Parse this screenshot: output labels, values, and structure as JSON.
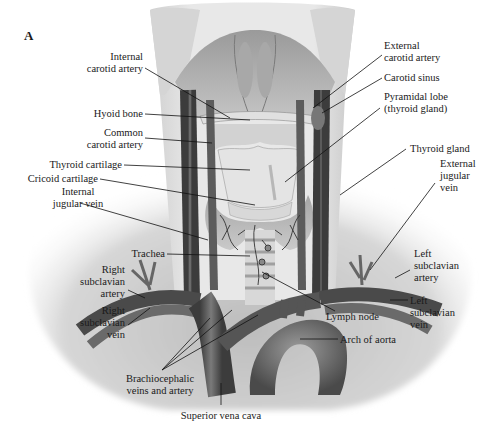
{
  "figure": {
    "panel_letter": "A",
    "labels": [
      {
        "id": "internal-carotid-artery",
        "lines": [
          "Internal",
          "carotid artery"
        ],
        "x": 143,
        "y": 60,
        "anchor": "end",
        "leader": [
          [
            145,
            68
          ],
          [
            230,
            118
          ]
        ]
      },
      {
        "id": "hyoid-bone",
        "lines": [
          "Hyoid bone"
        ],
        "x": 143,
        "y": 117,
        "anchor": "end",
        "leader": [
          [
            145,
            114
          ],
          [
            250,
            120
          ]
        ]
      },
      {
        "id": "common-carotid-artery",
        "lines": [
          "Common",
          "carotid artery"
        ],
        "x": 143,
        "y": 136,
        "anchor": "end",
        "leader": [
          [
            145,
            138
          ],
          [
            212,
            143
          ]
        ]
      },
      {
        "id": "thyroid-cartilage",
        "lines": [
          "Thyroid cartilage"
        ],
        "x": 122,
        "y": 168,
        "anchor": "end",
        "leader": [
          [
            124,
            165
          ],
          [
            250,
            170
          ]
        ]
      },
      {
        "id": "cricoid-cartilage",
        "lines": [
          "Cricoid cartilage"
        ],
        "x": 98,
        "y": 182,
        "anchor": "end",
        "leader": [
          [
            100,
            179
          ],
          [
            255,
            205
          ]
        ]
      },
      {
        "id": "internal-jugular-vein",
        "lines": [
          "Internal",
          "jugular vein"
        ],
        "x": 78,
        "y": 195,
        "anchor": "middle",
        "leader": [
          [
            80,
            203
          ],
          [
            208,
            240
          ]
        ]
      },
      {
        "id": "trachea",
        "lines": [
          "Trachea"
        ],
        "x": 165,
        "y": 257,
        "anchor": "end",
        "leader": [
          [
            167,
            254
          ],
          [
            250,
            256
          ]
        ]
      },
      {
        "id": "right-subclavian-artery",
        "lines": [
          "Right",
          "subclavian",
          "artery"
        ],
        "x": 125,
        "y": 273,
        "anchor": "end",
        "leader": [
          [
            128,
            290
          ],
          [
            145,
            298
          ]
        ]
      },
      {
        "id": "right-subclavian-vein",
        "lines": [
          "Right",
          "subclavian",
          "vein"
        ],
        "x": 125,
        "y": 314,
        "anchor": "end",
        "leader": [
          [
            128,
            325
          ],
          [
            150,
            308
          ]
        ]
      },
      {
        "id": "brachiocephalic-veins-and-artery",
        "lines": [
          "Brachiocephalic",
          "veins and artery"
        ],
        "x": 160,
        "y": 382,
        "anchor": "middle",
        "leader": [
          [
            162,
            370
          ],
          [
            210,
            318
          ]
        ],
        "extra_leaders": [
          [
            [
              162,
              370
            ],
            [
              232,
              310
            ]
          ],
          [
            [
              162,
              370
            ],
            [
              258,
              315
            ]
          ]
        ]
      },
      {
        "id": "superior-vena-cava",
        "lines": [
          "Superior vena cava"
        ],
        "x": 221,
        "y": 419,
        "anchor": "middle",
        "leader": [
          [
            221,
            405
          ],
          [
            221,
            383
          ]
        ]
      },
      {
        "id": "arch-of-aorta",
        "lines": [
          "Arch of aorta"
        ],
        "x": 340,
        "y": 343,
        "anchor": "start",
        "leader": [
          [
            338,
            339
          ],
          [
            300,
            339
          ]
        ]
      },
      {
        "id": "lymph-node",
        "lines": [
          "Lymph node"
        ],
        "x": 326,
        "y": 320,
        "anchor": "start",
        "leader": [
          [
            335,
            311
          ],
          [
            262,
            272
          ]
        ]
      },
      {
        "id": "left-subclavian-vein",
        "lines": [
          "Left",
          "subclavian",
          "vein"
        ],
        "x": 410,
        "y": 304,
        "anchor": "start",
        "leader": [
          [
            408,
            300
          ],
          [
            390,
            300
          ]
        ]
      },
      {
        "id": "left-subclavian-artery",
        "lines": [
          "Left",
          "subclavian",
          "artery"
        ],
        "x": 414,
        "y": 257,
        "anchor": "start",
        "leader": [
          [
            410,
            270
          ],
          [
            395,
            278
          ]
        ]
      },
      {
        "id": "external-jugular-vein",
        "lines": [
          "External",
          "jugular",
          "vein"
        ],
        "x": 440,
        "y": 167,
        "anchor": "start",
        "leader": [
          [
            435,
            183
          ],
          [
            370,
            270
          ]
        ]
      },
      {
        "id": "thyroid-gland",
        "lines": [
          "Thyroid gland"
        ],
        "x": 410,
        "y": 152,
        "anchor": "start",
        "leader": [
          [
            406,
            149
          ],
          [
            340,
            195
          ]
        ]
      },
      {
        "id": "pyramidal-lobe",
        "lines": [
          "Pyramidal lobe",
          "(thyroid gland)"
        ],
        "x": 384,
        "y": 100,
        "anchor": "start",
        "leader": [
          [
            380,
            108
          ],
          [
            285,
            182
          ]
        ]
      },
      {
        "id": "carotid-sinus",
        "lines": [
          "Carotid sinus"
        ],
        "x": 384,
        "y": 81,
        "anchor": "start",
        "leader": [
          [
            382,
            78
          ],
          [
            322,
            113
          ]
        ]
      },
      {
        "id": "external-carotid-artery",
        "lines": [
          "External",
          "carotid artery"
        ],
        "x": 384,
        "y": 49,
        "anchor": "start",
        "leader": [
          [
            382,
            55
          ],
          [
            313,
            108
          ]
        ]
      }
    ]
  },
  "colors": {
    "background": "#ffffff",
    "skin_light": "#e6e6e6",
    "skin_mid": "#c9c9c9",
    "muscle": "#b5b5b5",
    "vessel_dark": "#4a4a4a",
    "vessel_mid": "#6b6b6b",
    "gland": "#dcdcdc",
    "ink": "#111111"
  }
}
